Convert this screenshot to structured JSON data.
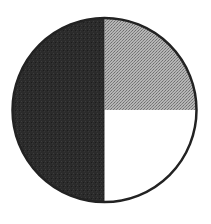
{
  "chart_data": {
    "type": "pie",
    "title": "",
    "categories": [
      "Dark slice",
      "Stippled gray slice",
      "White slice"
    ],
    "values": [
      50,
      25,
      25
    ],
    "colors": [
      "#2a2a2a",
      "#9a9a9a",
      "#ffffff"
    ],
    "start_angle_deg": -90,
    "direction": "clockwise_from_top",
    "order_clockwise_from_top": [
      "Stippled gray slice",
      "White slice",
      "Dark slice"
    ],
    "legend": "none",
    "labels": "none",
    "outline_color": "#222222"
  }
}
